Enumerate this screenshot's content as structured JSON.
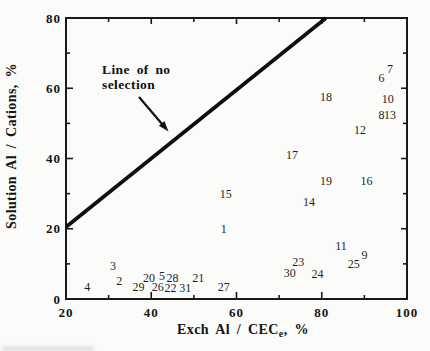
{
  "figure": {
    "background": "#fbfbf9",
    "ink_color": "#1a1a1a"
  },
  "chart_data": {
    "type": "scatter",
    "marker": "numeric-sample-labels",
    "xlabel": "Exch Al / CEC_e, %",
    "xlabel_parts": {
      "main": "Exch Al / CEC",
      "sub": "e",
      "suffix": ", %"
    },
    "ylabel": "Solution Al / Cations, %",
    "xlim": [
      20,
      100
    ],
    "ylim": [
      0,
      80
    ],
    "x_major_ticks": [
      20,
      40,
      60,
      80,
      100
    ],
    "x_minor_ticks": [
      30,
      50,
      70,
      90
    ],
    "y_major_ticks": [
      0,
      20,
      40,
      60,
      80
    ],
    "y_minor_ticks": [
      10,
      30,
      50,
      70
    ],
    "grid": false,
    "reference_line": {
      "from": [
        20,
        20.5
      ],
      "to": [
        81,
        80
      ]
    },
    "annotation": {
      "line1": "Line of no",
      "line2": "selection"
    },
    "points": [
      {
        "label": "1",
        "x": 57,
        "y": 20
      },
      {
        "label": "2",
        "x": 32.5,
        "y": 5
      },
      {
        "label": "3",
        "x": 31,
        "y": 9.5
      },
      {
        "label": "4",
        "x": 25,
        "y": 3.5
      },
      {
        "label": "5",
        "x": 42.5,
        "y": 6.5
      },
      {
        "label": "6",
        "x": 94,
        "y": 63
      },
      {
        "label": "7",
        "x": 96,
        "y": 65.5
      },
      {
        "label": "8",
        "x": 94,
        "y": 52.5
      },
      {
        "label": "9",
        "x": 90,
        "y": 12.5
      },
      {
        "label": "10",
        "x": 95.5,
        "y": 57
      },
      {
        "label": "11",
        "x": 84.5,
        "y": 15
      },
      {
        "label": "12",
        "x": 89,
        "y": 48
      },
      {
        "label": "13",
        "x": 96,
        "y": 52.5
      },
      {
        "label": "14",
        "x": 77,
        "y": 27.5
      },
      {
        "label": "15",
        "x": 57.5,
        "y": 30
      },
      {
        "label": "16",
        "x": 90.5,
        "y": 33.5
      },
      {
        "label": "17",
        "x": 73,
        "y": 41
      },
      {
        "label": "18",
        "x": 81,
        "y": 57.5
      },
      {
        "label": "19",
        "x": 81,
        "y": 33.5
      },
      {
        "label": "20",
        "x": 39.5,
        "y": 6
      },
      {
        "label": "21",
        "x": 51,
        "y": 6
      },
      {
        "label": "22",
        "x": 44.5,
        "y": 3
      },
      {
        "label": "23",
        "x": 74.5,
        "y": 10.5
      },
      {
        "label": "24",
        "x": 79,
        "y": 7
      },
      {
        "label": "25",
        "x": 87.5,
        "y": 10
      },
      {
        "label": "26",
        "x": 41.5,
        "y": 3.5
      },
      {
        "label": "27",
        "x": 57,
        "y": 3.5
      },
      {
        "label": "28",
        "x": 45,
        "y": 6
      },
      {
        "label": "29",
        "x": 37,
        "y": 3.5
      },
      {
        "label": "30",
        "x": 72.5,
        "y": 7.5
      },
      {
        "label": "31",
        "x": 48,
        "y": 3
      }
    ]
  }
}
